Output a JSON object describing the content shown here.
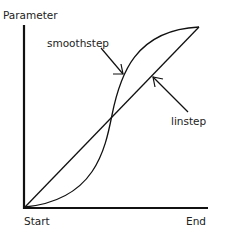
{
  "labels": {
    "y_axis": "Parameter",
    "x_start": "Start",
    "x_end": "End",
    "curve_smoothstep": "smoothstep",
    "curve_linstep": "linstep"
  },
  "colors": {
    "line": "#111111",
    "background": "#ffffff"
  }
}
